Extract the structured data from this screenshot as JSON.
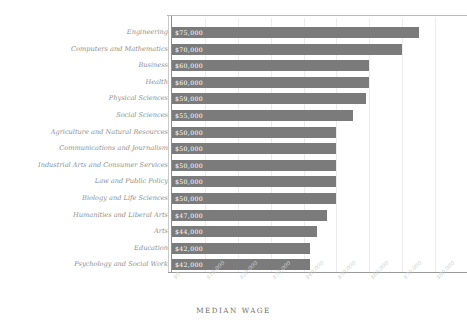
{
  "chart_data": {
    "type": "bar",
    "orientation": "horizontal",
    "title": "",
    "xlabel": "MEDIAN WAGE",
    "ylabel": "",
    "xlim": [
      0,
      80000
    ],
    "grid": true,
    "legend": "none",
    "xticks": [
      "$0",
      "$10,000",
      "$20,000",
      "$30,000",
      "$40,000",
      "$50,000",
      "$60,000",
      "$70,000",
      "$80,000"
    ],
    "xtick_values": [
      0,
      10000,
      20000,
      30000,
      40000,
      50000,
      60000,
      70000,
      80000
    ],
    "categories": [
      "Engineering",
      "Computers and Mathematics",
      "Business",
      "Health",
      "Physical Sciences",
      "Social Sciences",
      "Agriculture and Natural Resources",
      "Communications and Journalism",
      "Industrial Arts and Consumer Services",
      "Law and Public Policy",
      "Biology and Life Sciences",
      "Humanities and Liberal Arts",
      "Arts",
      "Education",
      "Psychology and Social Work"
    ],
    "values": [
      75000,
      70000,
      60000,
      60000,
      59000,
      55000,
      50000,
      50000,
      50000,
      50000,
      50000,
      47000,
      44000,
      42000,
      42000
    ],
    "value_labels": [
      "$75,000",
      "$70,000",
      "$60,000",
      "$60,000",
      "$59,000",
      "$55,000",
      "$50,000",
      "$50,000",
      "$50,000",
      "$50,000",
      "$50,000",
      "$47,000",
      "$44,000",
      "$42,000",
      "$42,000"
    ],
    "colors": {
      "bar": "#7b7b7b",
      "value_label": "#ffffff",
      "category_label": "#8e8e8e",
      "tick_label": "#cfcfcf",
      "gridline": "#ececec",
      "axis": "#8d8d8d",
      "background": "#ffffff",
      "axis_title": "#6f6f6f"
    }
  }
}
